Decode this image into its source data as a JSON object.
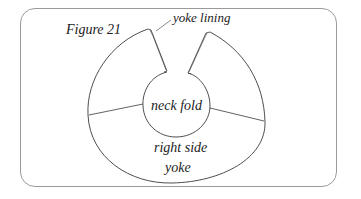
{
  "figure": {
    "title": "Figure 21",
    "labels": {
      "yoke_lining": "yoke lining",
      "neck_fold": "neck fold",
      "right_side": "right side",
      "yoke": "yoke"
    }
  },
  "colors": {
    "line": "#3a3a3a",
    "frame": "#9a9a9a",
    "text": "#222222",
    "background": "#ffffff"
  }
}
